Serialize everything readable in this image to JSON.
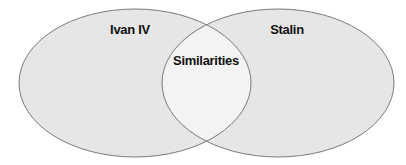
{
  "diagram": {
    "type": "venn",
    "sets": [
      {
        "label": "Ivan IV",
        "fill": "#e6e6e6",
        "stroke": "#7a7a7a"
      },
      {
        "label": "Stalin",
        "fill": "#e6e6e6",
        "stroke": "#7a7a7a"
      }
    ],
    "intersection": {
      "label": "Similarities",
      "fill": "#f2f2f2"
    }
  }
}
